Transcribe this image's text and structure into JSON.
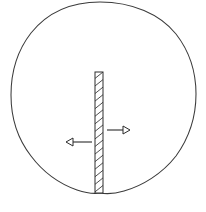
{
  "figure": {
    "background_color": "#ffffff",
    "outline_color": "#3a3a3a",
    "partition_color": "#2e2e2e",
    "arrow_color": "#2b2b2b",
    "canvas": {
      "width": 206,
      "height": 212
    }
  },
  "shapes": {
    "outline": {
      "name": "egg-outline",
      "path": "M 100 2 C 132 2 160 14 176 34 C 190 52 196 74 196 94 C 196 116 189 138 176 156 C 162 174 142 186 124 191 C 114 194 106 194 100 193 C 94 194 86 193 77 190 C 60 184 43 172 31 156 C 17 138 11 116 11 95 C 11 74 17 51 31 33 C 47 13 70 2 100 2 Z",
      "widest_left_x": 11,
      "widest_right_x": 196,
      "top_y": 2,
      "bottom_point": {
        "x": 100,
        "y": 193
      }
    },
    "partition": {
      "name": "hatched-partition",
      "x": 95,
      "y": 72,
      "width": 8,
      "height": 121,
      "hatch_angle_deg": 58,
      "hatch_count": 16
    }
  },
  "arrows": [
    {
      "name": "arrow-right",
      "direction": "right",
      "shaft_start": {
        "x": 107,
        "y": 130
      },
      "shaft_end": {
        "x": 124,
        "y": 130
      },
      "head_tip": {
        "x": 130,
        "y": 130
      },
      "head_length": 7,
      "head_half_width": 4
    },
    {
      "name": "arrow-left",
      "direction": "left",
      "shaft_start": {
        "x": 92,
        "y": 142
      },
      "shaft_end": {
        "x": 73,
        "y": 142
      },
      "head_tip": {
        "x": 66,
        "y": 142
      },
      "head_length": 7,
      "head_half_width": 4
    }
  ]
}
